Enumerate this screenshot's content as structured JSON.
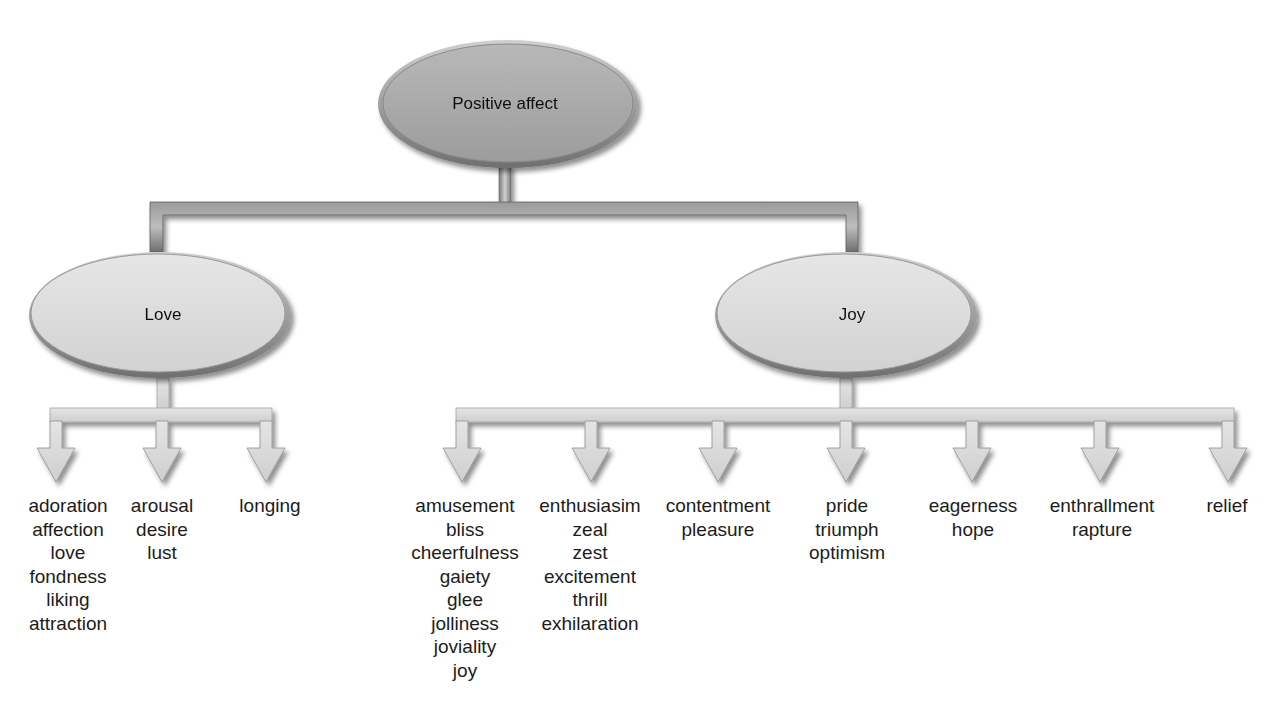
{
  "diagram": {
    "root": {
      "label": "Positive affect"
    },
    "branches": [
      {
        "label": "Love",
        "children": [
          [
            "adoration",
            "affection",
            "love",
            "fondness",
            "liking",
            "attraction"
          ],
          [
            "arousal",
            "desire",
            "lust"
          ],
          [
            "longing"
          ]
        ]
      },
      {
        "label": "Joy",
        "children": [
          [
            "amusement",
            "bliss",
            "cheerfulness",
            "gaiety",
            "glee",
            "jolliness",
            "joviality",
            "joy"
          ],
          [
            "enthusiasim",
            "zeal",
            "zest",
            "excitement",
            "thrill",
            "exhilaration"
          ],
          [
            "contentment",
            "pleasure"
          ],
          [
            "pride",
            "triumph",
            "optimism"
          ],
          [
            "eagerness",
            "hope"
          ],
          [
            "enthrallment",
            "rapture"
          ],
          [
            "relief"
          ]
        ]
      }
    ]
  },
  "colors": {
    "root_fill": "#a9a9a9",
    "branch_fill": "#dcdcdc",
    "connector_dark": "#8a8a8a",
    "arrow_fill": "#d8d8d8"
  }
}
